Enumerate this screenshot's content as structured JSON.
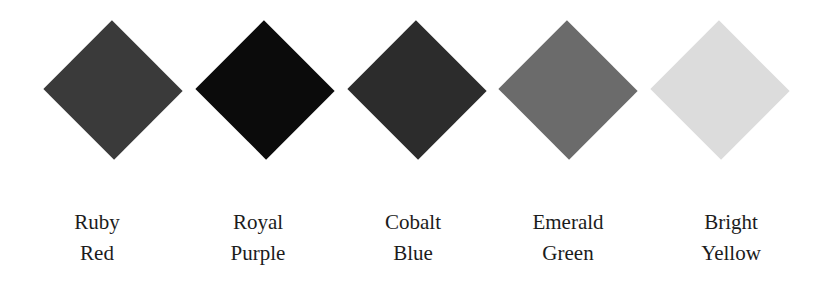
{
  "swatches": [
    {
      "line1": "Ruby",
      "line2": "Red",
      "color": "#3a3a3a",
      "cx": 113,
      "label_cx": 97
    },
    {
      "line1": "Royal",
      "line2": "Purple",
      "color": "#0b0b0b",
      "cx": 265,
      "label_cx": 258
    },
    {
      "line1": "Cobalt",
      "line2": "Blue",
      "color": "#2c2c2c",
      "cx": 417,
      "label_cx": 413
    },
    {
      "line1": "Emerald",
      "line2": "Green",
      "color": "#6b6b6b",
      "cx": 568,
      "label_cx": 568
    },
    {
      "line1": "Bright",
      "line2": "Yellow",
      "color": "#dcdcdc",
      "cx": 720,
      "label_cx": 731
    }
  ]
}
